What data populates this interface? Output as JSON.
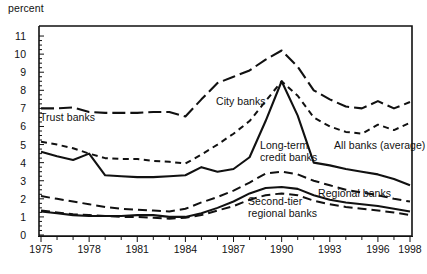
{
  "chart_data": {
    "type": "line",
    "title": "",
    "subtitle": "",
    "ylabel": "percent",
    "xlabel": "",
    "ylim": [
      0,
      11.5
    ],
    "xlim": [
      1975,
      1998
    ],
    "yticks": [
      0,
      1,
      2,
      3,
      4,
      5,
      6,
      7,
      8,
      9,
      10,
      11
    ],
    "ytick_labels": [
      "0",
      "1",
      "2",
      "3",
      "4",
      "5",
      "6",
      "7",
      "8",
      "9",
      "10",
      "11"
    ],
    "xticks": [
      1975,
      1978,
      1981,
      1984,
      1987,
      1990,
      1993,
      1996,
      1998
    ],
    "xtick_labels": [
      "1975",
      "1978",
      "1981",
      "1984",
      "1987",
      "1990",
      "1993",
      "1996",
      "1998"
    ],
    "minor_xticks_every": 1,
    "grid": false,
    "legend": "inline-annotations",
    "x": [
      1975,
      1976,
      1977,
      1978,
      1979,
      1980,
      1981,
      1982,
      1983,
      1984,
      1985,
      1986,
      1987,
      1988,
      1989,
      1990,
      1991,
      1992,
      1993,
      1994,
      1995,
      1996,
      1997,
      1998
    ],
    "series": [
      {
        "name": "Trust banks",
        "style": "long-dash",
        "label": "Trust banks",
        "values": [
          7.0,
          7.0,
          7.05,
          6.8,
          6.75,
          6.75,
          6.75,
          6.8,
          6.8,
          6.55,
          7.5,
          8.4,
          8.75,
          9.1,
          9.7,
          10.2,
          9.3,
          8.0,
          7.5,
          7.1,
          7.0,
          7.4,
          7.0,
          7.35
        ]
      },
      {
        "name": "City banks",
        "style": "short-dash",
        "label": "City banks",
        "values": [
          5.15,
          5.0,
          4.8,
          4.5,
          4.25,
          4.2,
          4.2,
          4.1,
          4.05,
          3.95,
          4.45,
          5.0,
          5.6,
          6.3,
          7.4,
          8.5,
          7.7,
          6.5,
          6.0,
          5.7,
          5.6,
          6.1,
          5.8,
          6.2
        ]
      },
      {
        "name": "Long-term credit banks",
        "style": "solid",
        "label": "Long-term\ncredit banks",
        "values": [
          4.6,
          4.35,
          4.15,
          4.5,
          3.3,
          3.25,
          3.2,
          3.2,
          3.25,
          3.3,
          3.75,
          3.5,
          3.65,
          4.3,
          6.3,
          8.5,
          6.6,
          4.0,
          3.85,
          3.65,
          3.5,
          3.35,
          3.1,
          2.75
        ]
      },
      {
        "name": "All banks (average)",
        "style": "medium-dash",
        "label": "All banks (average)",
        "values": [
          2.15,
          2.0,
          1.85,
          1.7,
          1.55,
          1.45,
          1.4,
          1.35,
          1.3,
          1.45,
          1.8,
          2.1,
          2.45,
          2.9,
          3.4,
          3.5,
          3.35,
          3.0,
          2.75,
          2.5,
          2.35,
          2.2,
          2.0,
          1.85
        ]
      },
      {
        "name": "Regional banks",
        "style": "solid-thin",
        "label": "Regional banks",
        "values": [
          1.3,
          1.2,
          1.1,
          1.05,
          1.05,
          1.05,
          1.1,
          1.1,
          1.0,
          1.0,
          1.2,
          1.5,
          1.85,
          2.3,
          2.6,
          2.65,
          2.55,
          2.2,
          1.95,
          1.8,
          1.7,
          1.6,
          1.45,
          1.3
        ]
      },
      {
        "name": "Second-tier regional banks",
        "style": "long-dash-2",
        "label": "Second-tier\nregional banks",
        "values": [
          1.35,
          1.25,
          1.15,
          1.1,
          1.05,
          1.0,
          1.0,
          0.95,
          0.9,
          0.95,
          1.1,
          1.35,
          1.6,
          1.95,
          2.2,
          2.3,
          2.2,
          1.9,
          1.7,
          1.55,
          1.45,
          1.35,
          1.25,
          1.1
        ]
      }
    ],
    "annotations": [
      {
        "name": "trust-banks-label",
        "text": "Trust banks",
        "x_px": 40,
        "y_px": 112
      },
      {
        "name": "city-banks-label",
        "text": "City banks",
        "x_px": 216,
        "y_px": 96
      },
      {
        "name": "long-term-credit-label",
        "text": "Long-term\ncredit banks",
        "x_px": 260,
        "y_px": 140
      },
      {
        "name": "all-banks-average-label",
        "text": "All banks (average)",
        "x_px": 334,
        "y_px": 140
      },
      {
        "name": "regional-banks-label",
        "text": "Regional banks",
        "x_px": 318,
        "y_px": 188
      },
      {
        "name": "second-tier-label",
        "text": "Second-tier\nregional banks",
        "x_px": 248,
        "y_px": 196
      }
    ],
    "colors": {
      "line": "#111111",
      "background": "#ffffff",
      "frame": "#111111"
    }
  }
}
